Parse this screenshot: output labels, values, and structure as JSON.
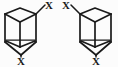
{
  "figure": {
    "caption": "",
    "type": "chemical-structure-pair",
    "background_color": "#fcfcfc",
    "line_color": "#1a1a1a"
  },
  "structures": [
    {
      "id": "left-structure",
      "name": "bicyclic-cage-left",
      "top_substituent_label": "X",
      "bottom_substituent_label": "X",
      "top_substituent_side": "right"
    },
    {
      "id": "right-structure",
      "name": "bicyclic-cage-right",
      "top_substituent_label": "X",
      "bottom_substituent_label": "X",
      "top_substituent_side": "left"
    }
  ]
}
